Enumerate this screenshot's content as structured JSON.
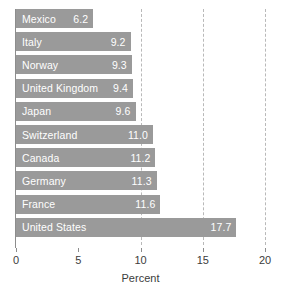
{
  "chart_data": {
    "type": "bar",
    "orientation": "horizontal",
    "title": "",
    "subtitle": "",
    "xlabel": "Percent",
    "ylabel": "",
    "xlim": [
      0,
      20
    ],
    "xticks": [
      0,
      5,
      10,
      15,
      20
    ],
    "xtick_labels": [
      "0",
      "5",
      "10",
      "15",
      "20"
    ],
    "grid": "vertical dashed gridlines at 10, 15, 20",
    "gridlines": [
      10,
      15,
      20
    ],
    "legend": "none",
    "categories": [
      "Mexico",
      "Italy",
      "Norway",
      "United Kingdom",
      "Japan",
      "Switzerland",
      "Canada",
      "Germany",
      "France",
      "United States"
    ],
    "values": [
      6.2,
      9.2,
      9.3,
      9.4,
      9.6,
      11.0,
      11.2,
      11.3,
      11.6,
      17.7
    ],
    "value_labels": [
      "6.2",
      "9.2",
      "9.3",
      "9.4",
      "9.6",
      "11.0",
      "11.2",
      "11.3",
      "11.6",
      "17.7"
    ],
    "bars": [
      {
        "label": "Mexico",
        "value": 6.2,
        "value_label": "6.2"
      },
      {
        "label": "Italy",
        "value": 9.2,
        "value_label": "9.2"
      },
      {
        "label": "Norway",
        "value": 9.3,
        "value_label": "9.3"
      },
      {
        "label": "United Kingdom",
        "value": 9.4,
        "value_label": "9.4"
      },
      {
        "label": "Japan",
        "value": 9.6,
        "value_label": "9.6"
      },
      {
        "label": "Switzerland",
        "value": 11.0,
        "value_label": "11.0"
      },
      {
        "label": "Canada",
        "value": 11.2,
        "value_label": "11.2"
      },
      {
        "label": "Germany",
        "value": 11.3,
        "value_label": "11.3"
      },
      {
        "label": "France",
        "value": 11.6,
        "value_label": "11.6"
      },
      {
        "label": "United States",
        "value": 17.7,
        "value_label": "17.7"
      }
    ],
    "colors": {
      "bar": "#9a9a9a",
      "bar_text": "#ffffff",
      "axis": "#8d8d8d",
      "gridline": "#b9b9b9",
      "tick_text": "#3c3c3c",
      "background": "#ffffff"
    }
  }
}
